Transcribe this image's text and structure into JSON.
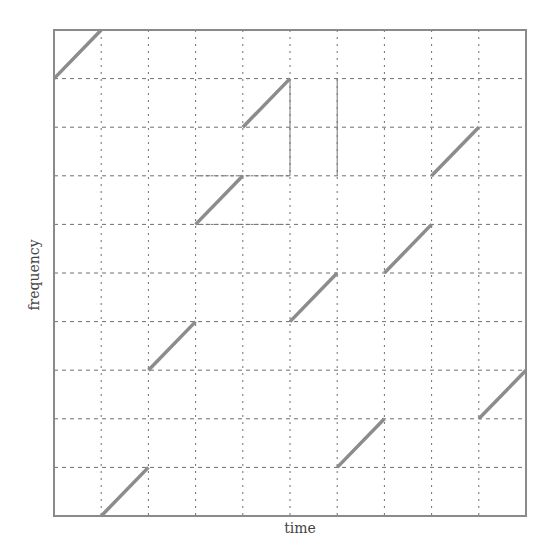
{
  "chart_data": {
    "type": "line",
    "title": "",
    "xlabel": "time",
    "ylabel": "frequency",
    "xlim": [
      0,
      10
    ],
    "ylim": [
      0,
      10
    ],
    "grid": true,
    "grid_divisions": {
      "x": 10,
      "y": 10
    },
    "tick_labels": {
      "x": [],
      "y": []
    },
    "legend": null,
    "series": [
      {
        "name": "segment-1",
        "x": [
          0,
          1
        ],
        "y": [
          9,
          10
        ]
      },
      {
        "name": "segment-2",
        "x": [
          1,
          2
        ],
        "y": [
          0,
          1
        ]
      },
      {
        "name": "segment-3",
        "x": [
          2,
          3
        ],
        "y": [
          3,
          4
        ]
      },
      {
        "name": "segment-4",
        "x": [
          3,
          4
        ],
        "y": [
          6,
          7
        ]
      },
      {
        "name": "segment-5",
        "x": [
          4,
          5
        ],
        "y": [
          8,
          9
        ]
      },
      {
        "name": "segment-6",
        "x": [
          5,
          6
        ],
        "y": [
          4,
          5
        ]
      },
      {
        "name": "segment-7",
        "x": [
          6,
          7
        ],
        "y": [
          1,
          2
        ]
      },
      {
        "name": "segment-8",
        "x": [
          7,
          8
        ],
        "y": [
          5,
          6
        ]
      },
      {
        "name": "segment-9",
        "x": [
          8,
          9
        ],
        "y": [
          7,
          8
        ]
      },
      {
        "name": "segment-10",
        "x": [
          9,
          10
        ],
        "y": [
          2,
          3
        ]
      }
    ],
    "colors": {
      "frame": "#8a8a8a",
      "grid": "#6f6f6f",
      "segment": "#8c8c8c",
      "label": "#444444"
    }
  }
}
